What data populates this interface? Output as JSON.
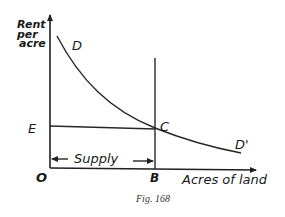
{
  "figure": {
    "caption": "Fig. 168",
    "background": "#ffffff",
    "ink_color": "#1f1f1f"
  },
  "axes": {
    "y_label_lines": [
      "Rent",
      "per",
      "acre"
    ],
    "x_label": "Acres of land",
    "origin_label": "O"
  },
  "points": {
    "D": "D",
    "D_prime": "D'",
    "C": "C",
    "E": "E",
    "B": "B"
  },
  "annotations": {
    "supply_label": "Supply"
  },
  "diagram_data": {
    "type": "economics-rent-diagram",
    "elements": [
      {
        "kind": "axis",
        "name": "y-axis",
        "label": "Rent per acre"
      },
      {
        "kind": "axis",
        "name": "x-axis",
        "label": "Acres of land"
      },
      {
        "kind": "curve",
        "name": "demand-curve",
        "from": "D",
        "to": "D'",
        "shape": "downward-sloping convex"
      },
      {
        "kind": "vertical-line",
        "name": "fixed-supply-line",
        "at": "B",
        "meaning": "perfectly inelastic supply of land"
      },
      {
        "kind": "horizontal-line",
        "name": "rent-level-line",
        "from": "E",
        "to": "C"
      },
      {
        "kind": "intersection",
        "name": "equilibrium-point",
        "label": "C"
      },
      {
        "kind": "double-arrow",
        "name": "supply-span",
        "from": "O",
        "to": "B",
        "label": "Supply"
      }
    ]
  }
}
